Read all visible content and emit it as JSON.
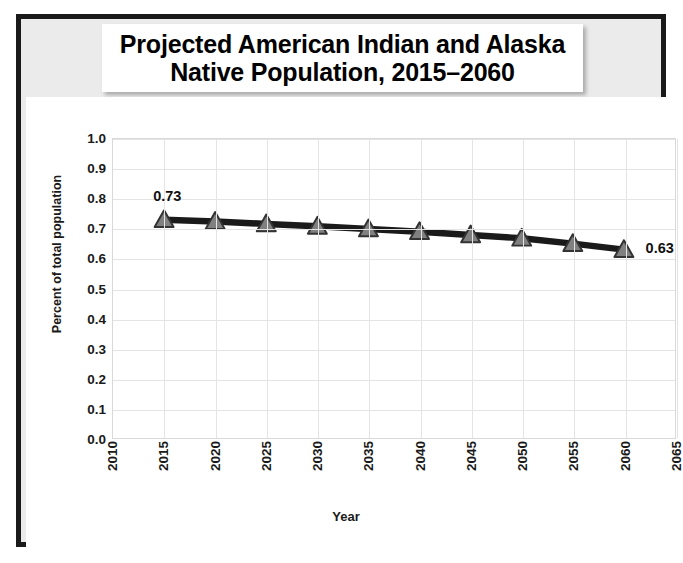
{
  "chart_data": {
    "type": "line",
    "title": "Projected American Indian and Alaska\nNative Population, 2015–2060",
    "xlabel": "Year",
    "ylabel": "Percent of total population",
    "x": [
      2015,
      2020,
      2025,
      2030,
      2035,
      2040,
      2045,
      2050,
      2055,
      2060
    ],
    "values": [
      0.73,
      0.724,
      0.716,
      0.708,
      0.699,
      0.69,
      0.679,
      0.668,
      0.65,
      0.63
    ],
    "series": [
      {
        "name": "Percent of total population",
        "values": [
          0.73,
          0.724,
          0.716,
          0.708,
          0.699,
          0.69,
          0.679,
          0.668,
          0.65,
          0.63
        ]
      }
    ],
    "xlim": [
      2010,
      2065
    ],
    "ylim": [
      0.0,
      1.0
    ],
    "xticks": [
      "2010",
      "2015",
      "2020",
      "2025",
      "2030",
      "2035",
      "2040",
      "2045",
      "2050",
      "2055",
      "2060",
      "2065"
    ],
    "yticks": [
      "0.0",
      "0.1",
      "0.2",
      "0.3",
      "0.4",
      "0.5",
      "0.6",
      "0.7",
      "0.8",
      "0.9",
      "1.0"
    ],
    "grid": true,
    "legend": "none",
    "marker": "triangle",
    "annotations": [
      {
        "text": "0.73",
        "x": 2015,
        "y": 0.73,
        "position": "above-left"
      },
      {
        "text": "0.63",
        "x": 2060,
        "y": 0.63,
        "position": "right"
      }
    ],
    "colors": {
      "line": "#1a1a1a",
      "marker_fill": "#808080",
      "marker_edge": "#333333",
      "grid": "#e4e4e4",
      "plot_background": "#ffffff",
      "slide_background": "#ebebeb",
      "frame": "#1a1a1a",
      "title_plate": "#ffffff",
      "text": "#1a1a1a"
    }
  }
}
